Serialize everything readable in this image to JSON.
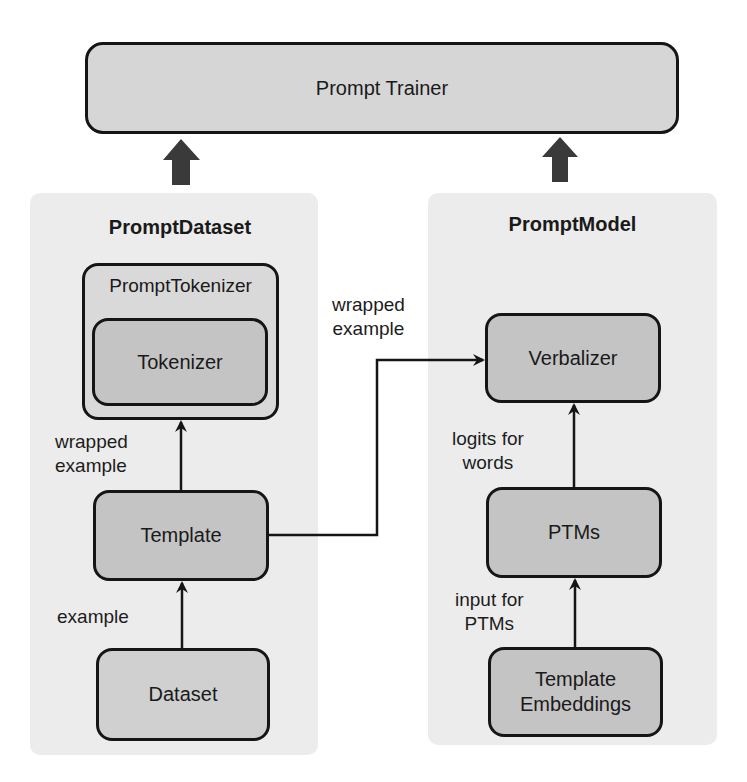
{
  "trainer": {
    "label": "Prompt Trainer"
  },
  "prompt_dataset": {
    "title": "PromptDataset",
    "prompt_tokenizer": {
      "label": "PromptTokenizer",
      "inner": "Tokenizer"
    },
    "template": "Template",
    "dataset": "Dataset",
    "edge_labels": {
      "template_to_tokenizer": "wrapped\nexample",
      "dataset_to_template": "example"
    }
  },
  "prompt_model": {
    "title": "PromptModel",
    "verbalizer": "Verbalizer",
    "ptms": "PTMs",
    "template_embeddings": "Template\nEmbeddings",
    "edge_labels": {
      "ptms_to_verbalizer": "logits for\nwords",
      "embeddings_to_ptms": "input for\nPTMs"
    }
  },
  "cross_edge": {
    "label": "wrapped\nexample"
  },
  "colors": {
    "panel_bg": "#ececec",
    "box_fill": "#c4c4c4",
    "trainer_fill": "#d6d6d6",
    "stroke": "#151515",
    "thick_arrow": "#3a3a3a"
  }
}
